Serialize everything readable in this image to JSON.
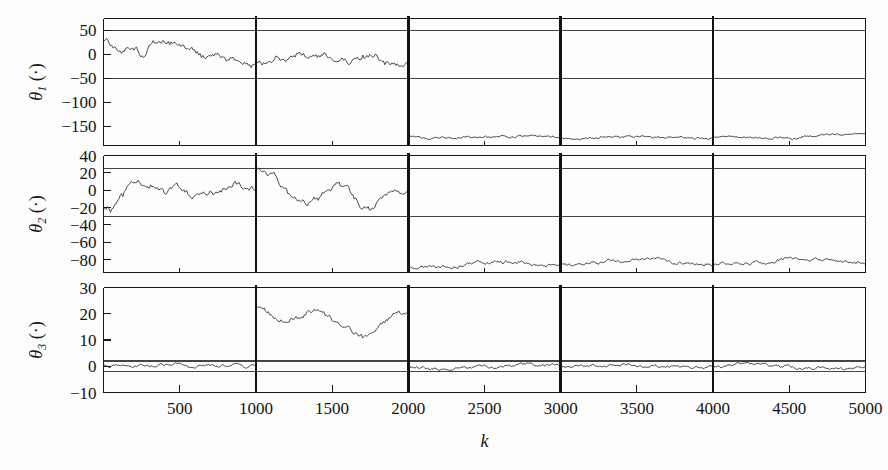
{
  "figure": {
    "title": "",
    "background_color": "#fdfdfd",
    "trace_color": "#2b2b2b",
    "axis_color": "#171717",
    "gridline_color": "#444444",
    "segment_divider_color": "#111111"
  },
  "axes": {
    "x": {
      "label": "k",
      "min": 0,
      "max": 5000,
      "ticks": [
        500,
        1000,
        1500,
        2000,
        2500,
        3000,
        3500,
        4000,
        4500,
        5000
      ],
      "tick_labels": [
        "500",
        "1000",
        "1500",
        "2000",
        "2500",
        "3000",
        "3500",
        "4000",
        "4500",
        "5000"
      ]
    },
    "segment_dividers": [
      1000,
      2000,
      3000,
      4000
    ]
  },
  "panels": [
    {
      "id": "theta1",
      "ylabel_symbol": "θ",
      "ylabel_subscript": "1",
      "ylabel_units": "(·)",
      "ymin": -190,
      "ymax": 75,
      "yticks": [
        50,
        0,
        -50,
        -100,
        -150
      ],
      "ytick_labels": [
        "50",
        "0",
        "−50",
        "−100",
        "−150"
      ],
      "gridlines": [
        50,
        -50
      ]
    },
    {
      "id": "theta2",
      "ylabel_symbol": "θ",
      "ylabel_subscript": "2",
      "ylabel_units": "(·)",
      "ymin": -95,
      "ymax": 40,
      "yticks": [
        40,
        20,
        0,
        -20,
        -40,
        -60,
        -80
      ],
      "ytick_labels": [
        "40",
        "20",
        "0",
        "−20",
        "−40",
        "−60",
        "−80"
      ],
      "gridlines": [
        25,
        -30
      ]
    },
    {
      "id": "theta3",
      "ylabel_symbol": "θ",
      "ylabel_subscript": "3",
      "ylabel_units": "(·)",
      "ymin": -10,
      "ymax": 30,
      "yticks": [
        30,
        20,
        10,
        0,
        -10
      ],
      "ytick_labels": [
        "30",
        "20",
        "10",
        "0",
        "−10"
      ],
      "gridlines": [
        2,
        -2
      ]
    }
  ],
  "chart_data": {
    "type": "line",
    "title": "",
    "xlabel": "k",
    "ylabel": "",
    "x": {
      "min": 0,
      "max": 5000,
      "step": 500,
      "ticks": [
        500,
        1000,
        1500,
        2000,
        2500,
        3000,
        3500,
        4000,
        4500,
        5000
      ]
    },
    "grid": "partial-horizontal-and-segment-verticals",
    "legend": "none",
    "subplots": [
      {
        "name": "theta_1",
        "ylabel": "θ₁ (·)",
        "ylim": [
          -190,
          75
        ],
        "yticks": [
          50,
          0,
          -50,
          -100,
          -150
        ],
        "hlines": [
          50,
          -50
        ],
        "segments": [
          {
            "x_start": 0,
            "x_end": 2000,
            "mean_profile": [
              30,
              8,
              -2,
              25,
              18,
              2,
              -8,
              -14,
              -20,
              -18,
              -5,
              2,
              -4,
              -12,
              -10,
              -6,
              -18,
              -26
            ],
            "noise_amplitude": 9,
            "description": "noisy band drifting from +30 down to about -27"
          },
          {
            "x_start": 2000,
            "x_end": 5000,
            "mean_profile": [
              -172,
              -175,
              -174,
              -173,
              -170,
              -172,
              -174,
              -173,
              -172,
              -174,
              -175,
              -173,
              -172,
              -174,
              -173,
              -168,
              -165
            ],
            "noise_amplitude": 3,
            "description": "settles near -173 with small ripple, slight rise at the right end"
          }
        ],
        "discontinuity_at": 2000
      },
      {
        "name": "theta_2",
        "ylabel": "θ₂ (·)",
        "ylim": [
          -95,
          40
        ],
        "yticks": [
          40,
          20,
          0,
          -20,
          -40,
          -60,
          -80
        ],
        "hlines": [
          25,
          -30
        ],
        "segments": [
          {
            "x_start": 0,
            "x_end": 1000,
            "mean_profile": [
              -18,
              -22,
              -10,
              2,
              7,
              6,
              0,
              -2,
              1,
              -3,
              -6,
              -8,
              -4,
              4,
              10,
              8,
              3,
              0
            ],
            "noise_amplitude": 5,
            "description": "rises from -20 to about +8 then levels near 0"
          },
          {
            "x_start": 1000,
            "x_end": 2000,
            "mean_profile": [
              25,
              20,
              14,
              2,
              -8,
              -10,
              -12,
              -8,
              2,
              9,
              5,
              -6,
              -16,
              -20,
              -12,
              -4,
              0,
              -4
            ],
            "noise_amplitude": 5,
            "description": "starts at +25, oscillates down to -20 and recovers"
          },
          {
            "x_start": 2000,
            "x_end": 5000,
            "mean_profile": [
              -88,
              -90,
              -87,
              -84,
              -83,
              -85,
              -86,
              -84,
              -81,
              -80,
              -82,
              -85,
              -86,
              -84,
              -80,
              -79,
              -82,
              -83
            ],
            "noise_amplitude": 2.5,
            "description": "flat band near -84 with gentle undulation"
          }
        ],
        "discontinuity_at": 2000
      },
      {
        "name": "theta_3",
        "ylabel": "θ₃ (·)",
        "ylim": [
          -10,
          30
        ],
        "yticks": [
          30,
          20,
          10,
          0,
          -10
        ],
        "hlines": [
          2,
          -2
        ],
        "segments": [
          {
            "x_start": 0,
            "x_end": 1000,
            "mean_profile": [
              0.5,
              0.2,
              0.4,
              0.0,
              0.3,
              0.2,
              -0.2,
              0.6,
              1.2,
              0.4,
              -0.5,
              0.0,
              0.3,
              0.2,
              0.0,
              0.4,
              0.2,
              0.0
            ],
            "noise_amplitude": 0.7,
            "description": "near zero, hugging the +2/-2 band"
          },
          {
            "x_start": 1000,
            "x_end": 2000,
            "mean_profile": [
              22,
              21,
              18,
              17,
              19,
              18,
              21,
              22,
              19,
              17,
              15,
              13,
              11,
              12,
              15,
              18,
              20,
              20
            ],
            "noise_amplitude": 1.2,
            "description": "elevated plateau around 20 dipping to 11 near k=1700"
          },
          {
            "x_start": 2000,
            "x_end": 5000,
            "mean_profile": [
              -0.5,
              -1.0,
              -0.6,
              0.2,
              0.5,
              0.0,
              -0.4,
              0.3,
              0.6,
              0.2,
              -0.3,
              -0.6,
              0.4,
              1.0,
              0.3,
              -0.8,
              -0.9,
              -0.7
            ],
            "noise_amplitude": 0.7,
            "description": "returns to near zero with low-amplitude wander"
          }
        ],
        "discontinuity_at": 1000
      }
    ]
  }
}
